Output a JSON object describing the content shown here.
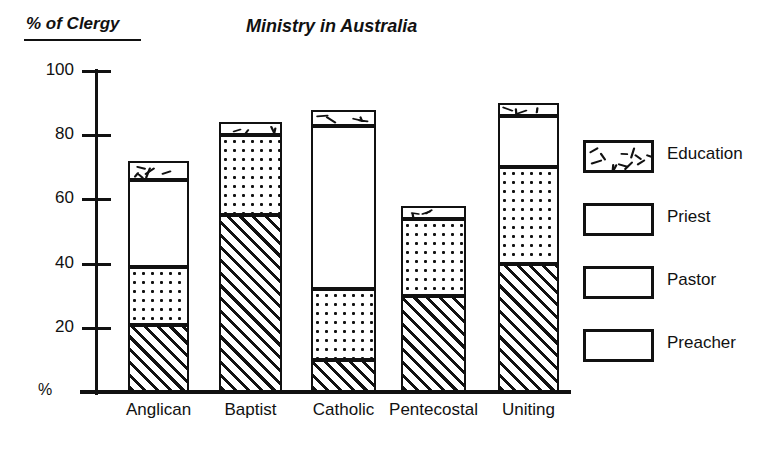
{
  "chart_data": {
    "type": "bar",
    "stacked": true,
    "title": "Ministry in Australia",
    "ylabel": "% of Clergy",
    "xlabel": "",
    "unit_label": "%",
    "ylim": [
      0,
      100
    ],
    "yticks": [
      0,
      20,
      40,
      60,
      80,
      100
    ],
    "ytick_labels": [
      "%",
      "20",
      "40",
      "60",
      "80",
      "100"
    ],
    "grid": false,
    "legend_position": "right",
    "categories": [
      "Anglican",
      "Baptist",
      "Catholic",
      "Pentecostal",
      "Uniting"
    ],
    "series": [
      {
        "name": "Preacher",
        "values": [
          21,
          55,
          10,
          30,
          40
        ]
      },
      {
        "name": "Pastor",
        "values": [
          18,
          25,
          22,
          24,
          30
        ]
      },
      {
        "name": "Priest",
        "values": [
          27,
          0,
          51,
          0,
          16
        ]
      },
      {
        "name": "Education",
        "values": [
          6,
          4,
          5,
          4,
          4
        ]
      }
    ],
    "totals": [
      72,
      84,
      88,
      58,
      90
    ]
  },
  "titles": {
    "y_axis_title": "% of Clergy",
    "main_title": "Ministry in Australia"
  },
  "axis": {
    "ticks": [
      {
        "label": "100",
        "value": 100
      },
      {
        "label": "80",
        "value": 80
      },
      {
        "label": "60",
        "value": 60
      },
      {
        "label": "40",
        "value": 40
      },
      {
        "label": "20",
        "value": 20
      }
    ],
    "origin_label": "%"
  },
  "categories": [
    {
      "label": "Anglican"
    },
    {
      "label": "Baptist"
    },
    {
      "label": "Catholic"
    },
    {
      "label": "Pentecostal"
    },
    {
      "label": "Uniting"
    }
  ],
  "legend": {
    "items": [
      {
        "label": "Education",
        "pattern": "dashes"
      },
      {
        "label": "Priest",
        "pattern": "plain"
      },
      {
        "label": "Pastor",
        "pattern": "dots"
      },
      {
        "label": "Preacher",
        "pattern": "hatch"
      }
    ]
  },
  "colors": {
    "ink": "#111111",
    "paper": "#ffffff"
  }
}
